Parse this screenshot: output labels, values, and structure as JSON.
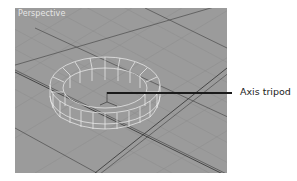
{
  "viewport": {
    "label": "Perspective",
    "background_color": "#9b9b9b",
    "grid_minor_color": "#8f8f8f",
    "grid_major_color": "#5a5a5a",
    "wireframe_color": "#f2f2f2"
  },
  "object": {
    "type": "tube",
    "segments": 18
  },
  "callouts": [
    {
      "label": "Axis tripod",
      "line_color": "#1a1a1a"
    }
  ]
}
